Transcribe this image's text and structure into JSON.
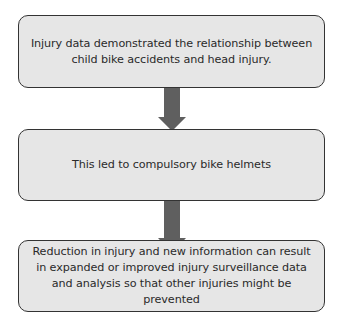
{
  "diagram": {
    "type": "flowchart",
    "direction": "top-to-bottom",
    "colors": {
      "box_fill": "#e6e6e6",
      "box_border": "#333333",
      "arrow": "#5f5f5f",
      "text": "#2a2a2a"
    },
    "steps": [
      {
        "text": "Injury data demonstrated the relationship between child bike accidents and head injury."
      },
      {
        "text": "This led to compulsory bike helmets"
      },
      {
        "text": "Reduction in injury and new information can result in expanded or improved injury surveillance data and analysis so that other injuries might be prevented"
      }
    ],
    "connectors": [
      {
        "from": 0,
        "to": 1,
        "icon": "down-arrow-icon"
      },
      {
        "from": 1,
        "to": 2,
        "icon": "down-arrow-icon"
      }
    ]
  }
}
